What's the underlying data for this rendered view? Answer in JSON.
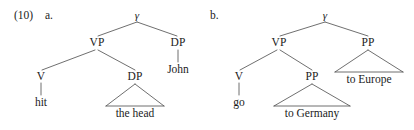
{
  "figure": {
    "example_number": "(10)",
    "background_color": "#ffffff",
    "line_color": "#4a4a4a",
    "text_color": "#1b1b1b"
  },
  "trees": [
    {
      "letter": "a.",
      "root_label": "γ",
      "nodes": {
        "root": "γ",
        "vp": "VP",
        "dp_object": "DP",
        "dp_subject": "DP",
        "v": "V"
      },
      "terminals": {
        "v_word": "hit",
        "subject_word": "John",
        "object_phrase": "the head"
      }
    },
    {
      "letter": "b.",
      "root_label": "γ",
      "nodes": {
        "root": "γ",
        "vp": "VP",
        "pp_inner": "PP",
        "pp_outer": "PP",
        "v": "V"
      },
      "terminals": {
        "v_word": "go",
        "inner_pp_phrase": "to Germany",
        "outer_pp_phrase": "to Europe"
      }
    }
  ]
}
